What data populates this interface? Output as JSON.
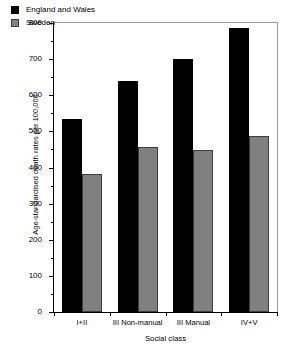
{
  "chart_data": {
    "type": "bar",
    "title": "",
    "subtitle": "",
    "xlabel": "Social class",
    "ylabel": "Age-standardised death rates per 100,000",
    "categories": [
      "I+II",
      "III Non-manual",
      "III Manual",
      "IV+V"
    ],
    "series": [
      {
        "name": "England and Wales",
        "color": "#000000",
        "values": [
          533,
          640,
          701,
          786
        ]
      },
      {
        "name": "Sweden",
        "color": "#808080",
        "values": [
          382,
          456,
          448,
          487
        ]
      }
    ],
    "ylim": [
      0,
      800
    ],
    "ytick_step": 100,
    "yminor_step": 50,
    "ytick_labels": [
      "0",
      "100",
      "200",
      "300",
      "400",
      "500",
      "600",
      "700",
      "800"
    ],
    "grid": false,
    "legend_position": "top-left",
    "frame": true
  }
}
